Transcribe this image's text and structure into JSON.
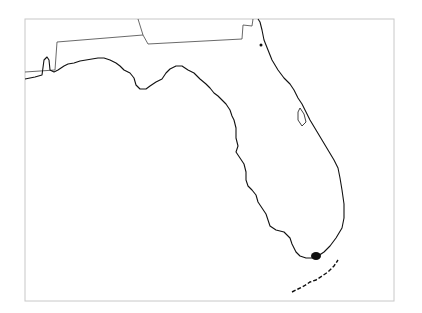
{
  "map": {
    "region": "Florida",
    "frame": {
      "x": 25,
      "y": 19,
      "width": 369,
      "height": 282,
      "stroke": "#c8c8c8"
    },
    "colors": {
      "coast": "#111111",
      "border": "#444444",
      "water": "#ffffff",
      "land": "#ffffff"
    },
    "state_border_path": "M25,72 L40,71 L55,70 L57,42 L143,35 L138,19 M143,35 L148,44 L242,39 L243,25 L252,26 L253,19",
    "coastline_path": "M25,79 L35,77 L42,75 L44,60 L47,57 L49,60 L50,70 L54,72 L58,70 L64,66 L68,64 L74,63 L80,61 L92,59 L98,58 L104,58 L110,60 L116,63 L120,66 L124,70 L130,73 L134,78 L136,85 L140,89 L146,89 L150,86 L156,82 L162,79 L166,73 L170,69 L176,66 L182,66 L188,70 L194,73 L200,79 L206,84 L210,88 L214,93 L218,96 L222,100 L226,104 L230,110 L232,116 L234,120 L236,128 L236,138 L238,146 L236,152 L240,158 L244,164 L246,172 L246,180 L248,186 L252,190 L256,195 L258,202 L262,208 L266,214 L268,220 L270,226 L276,230 L284,232 L290,238 L292,244 L296,252 L300,256 L306,258 L312,258 L318,256 L324,252 L330,246 L336,238 L342,228 L344,218 L344,204 L342,190 L340,178 L338,168 L334,160 L328,150 L322,140 L316,130 L310,120 L306,112 L302,104 L298,98 L294,90 L290,84 L284,78 L278,70 L272,60 L268,50 L264,40 L262,30 L260,22 L258,19",
    "keys_path": "M292,292 L298,289 L304,286 L310,282 L316,280 L322,276 L328,272 L334,266 L338,260",
    "features": {
      "lake_okeechobee": {
        "cx": 316,
        "cy": 256,
        "rx": 5,
        "ry": 4
      },
      "dot_marker": {
        "cx": 261,
        "cy": 45,
        "r": 1.5
      },
      "cape_lagoon": "M300,108 L304,114 L306,122 L302,126 L298,120 L298,112 Z"
    }
  }
}
